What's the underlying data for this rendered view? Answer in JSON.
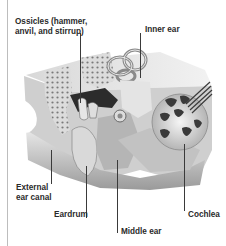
{
  "diagram": {
    "labels": {
      "ossicles_line1": "Ossicles (hammer,",
      "ossicles_line2": "anvil, and stirrup)",
      "inner_ear": "Inner ear",
      "external_line1": "External",
      "external_line2": "ear canal",
      "eardrum": "Eardrum",
      "middle_ear": "Middle ear",
      "cochlea": "Cochlea"
    },
    "colors": {
      "background": "#ffffff",
      "label_text": "#2a2a2a",
      "leader_line": "#3a3a3a",
      "frame_line": "#bdbdbd",
      "illustration_tone": "grayscale"
    }
  }
}
